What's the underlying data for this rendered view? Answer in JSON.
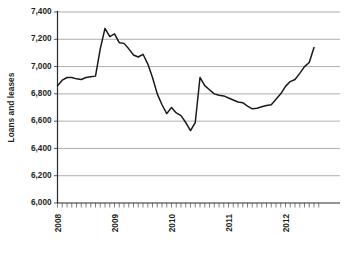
{
  "chart_data": {
    "type": "line",
    "title": "",
    "xlabel": "",
    "ylabel": "Loans and leases",
    "ylim": [
      6000,
      7400
    ],
    "xlim": [
      "2008-01",
      "2012-07"
    ],
    "grid": true,
    "legend": false,
    "y_ticks": [
      "6,000",
      "6,200",
      "6,400",
      "6,600",
      "6,800",
      "7,000",
      "7,200",
      "7,400"
    ],
    "y_tick_values": [
      6000,
      6200,
      6400,
      6600,
      6800,
      7000,
      7200,
      7400
    ],
    "x_ticks": [
      "2008",
      "2009",
      "2010",
      "2011",
      "2012"
    ],
    "x_tick_values": [
      2008,
      2009,
      2010,
      2011,
      2012
    ],
    "x_minor_tick_interval": "month",
    "line_color": "#1a1a1a",
    "grid_color": "#9a9a9a",
    "series": [
      {
        "name": "Loans and leases",
        "x": [
          "2008-01",
          "2008-02",
          "2008-03",
          "2008-04",
          "2008-05",
          "2008-06",
          "2008-07",
          "2008-08",
          "2008-09",
          "2008-10",
          "2008-11",
          "2008-12",
          "2009-01",
          "2009-02",
          "2009-03",
          "2009-04",
          "2009-05",
          "2009-06",
          "2009-07",
          "2009-08",
          "2009-09",
          "2009-10",
          "2009-11",
          "2009-12",
          "2010-01",
          "2010-02",
          "2010-03",
          "2010-04",
          "2010-05",
          "2010-06",
          "2010-07",
          "2010-08",
          "2010-09",
          "2010-10",
          "2010-11",
          "2010-12",
          "2011-01",
          "2011-02",
          "2011-03",
          "2011-04",
          "2011-05",
          "2011-06",
          "2011-07",
          "2011-08",
          "2011-09",
          "2011-10",
          "2011-11",
          "2011-12",
          "2012-01",
          "2012-02",
          "2012-03",
          "2012-04",
          "2012-05",
          "2012-06",
          "2012-07"
        ],
        "values": [
          6860,
          6900,
          6920,
          6920,
          6910,
          6905,
          6920,
          6925,
          6930,
          7130,
          7280,
          7220,
          7240,
          7175,
          7170,
          7130,
          7085,
          7070,
          7090,
          7020,
          6920,
          6800,
          6720,
          6655,
          6700,
          6660,
          6640,
          6590,
          6530,
          6590,
          6920,
          6860,
          6830,
          6800,
          6790,
          6785,
          6770,
          6755,
          6740,
          6735,
          6710,
          6690,
          6695,
          6705,
          6715,
          6720,
          6760,
          6800,
          6855,
          6890,
          6905,
          6950,
          7000,
          7030,
          7140
        ]
      }
    ]
  },
  "axis": {
    "y_title": "Loans and leases"
  }
}
